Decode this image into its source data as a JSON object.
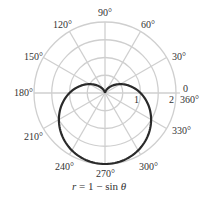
{
  "chart_data": {
    "type": "polar-line",
    "title": "",
    "caption": {
      "r": "r",
      "eq": " = 1 − sin ",
      "theta": "θ"
    },
    "equation": "r = 1 - sin θ",
    "radial_ticks": [
      {
        "value": 1,
        "label": "1"
      },
      {
        "value": 2,
        "label": "2"
      }
    ],
    "grid_circles": [
      0.5,
      1,
      1.5,
      2
    ],
    "rmax": 2,
    "angle_labels": [
      {
        "deg": 0,
        "label": "0"
      },
      {
        "deg": 360,
        "label": "360°"
      },
      {
        "deg": 30,
        "label": "30°"
      },
      {
        "deg": 60,
        "label": "60°"
      },
      {
        "deg": 90,
        "label": "90°"
      },
      {
        "deg": 120,
        "label": "120°"
      },
      {
        "deg": 150,
        "label": "150°"
      },
      {
        "deg": 180,
        "label": "180°"
      },
      {
        "deg": 210,
        "label": "210°"
      },
      {
        "deg": 240,
        "label": "240°"
      },
      {
        "deg": 270,
        "label": "270°"
      },
      {
        "deg": 300,
        "label": "300°"
      },
      {
        "deg": 330,
        "label": "330°"
      }
    ],
    "series": [
      {
        "name": "r = 1 - sin θ",
        "color": "#2a2a2a",
        "theta_deg": [
          0,
          30,
          60,
          90,
          120,
          150,
          180,
          210,
          240,
          270,
          300,
          330,
          360
        ],
        "r": [
          1,
          0.5,
          0.134,
          0,
          0.134,
          0.5,
          1,
          1.5,
          1.866,
          2,
          1.866,
          1.5,
          1
        ]
      }
    ],
    "grid": true,
    "colors": {
      "grid": "#cfcfcf",
      "curve": "#2a2a2a",
      "text": "#333333"
    }
  }
}
